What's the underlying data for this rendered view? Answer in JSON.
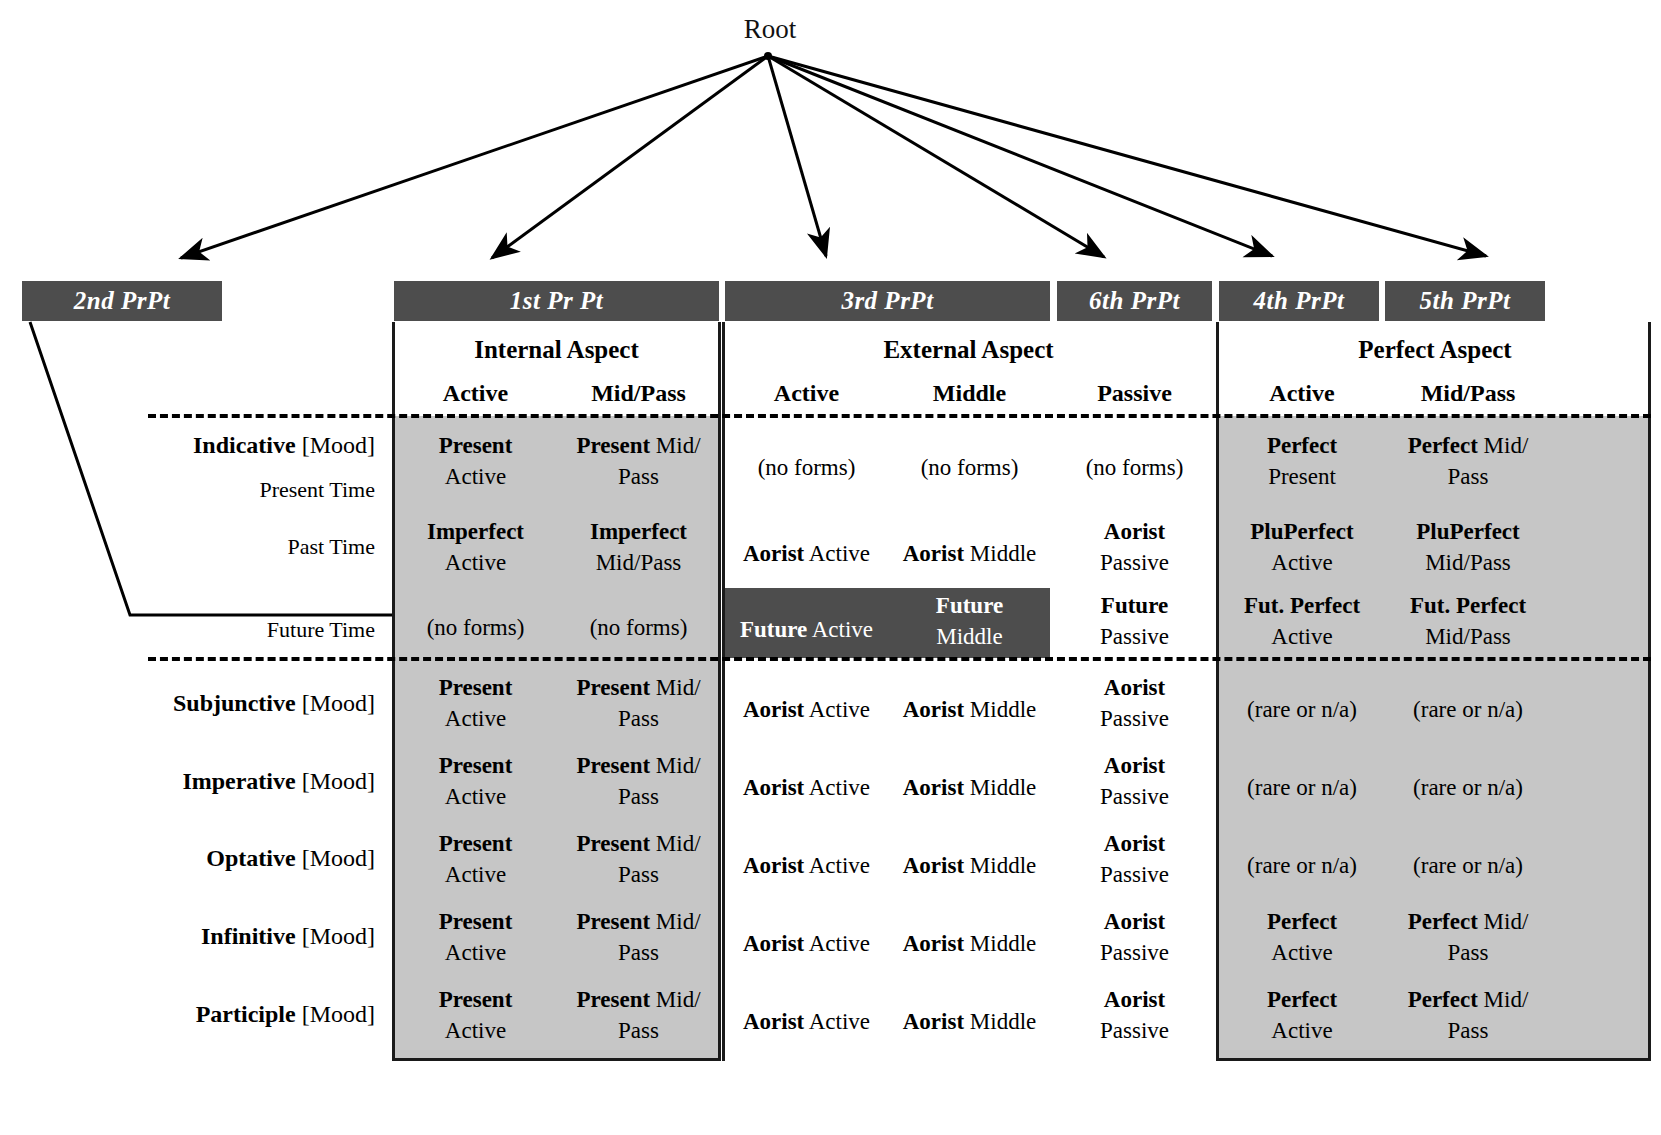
{
  "root": {
    "label": "Root"
  },
  "prpt_bars": [
    {
      "name": "2nd PrPt",
      "x": 22,
      "y": 281,
      "w": 200
    },
    {
      "name": "1st Pr Pt",
      "x": 394,
      "y": 281,
      "w": 325
    },
    {
      "name": "3rd PrPt",
      "x": 725,
      "y": 281,
      "w": 325
    },
    {
      "name": "6th PrPt",
      "x": 1057,
      "y": 281,
      "w": 155
    },
    {
      "name": "4th PrPt",
      "x": 1219,
      "y": 281,
      "w": 160
    },
    {
      "name": "5th PrPt",
      "x": 1385,
      "y": 281,
      "w": 160
    }
  ],
  "aspects": [
    {
      "label": "Internal Aspect",
      "x": 394,
      "w": 325
    },
    {
      "label": "External Aspect",
      "x": 725,
      "w": 487
    },
    {
      "label": "Perfect Aspect",
      "x": 1219,
      "w": 432
    }
  ],
  "voice_headers": [
    {
      "label": "Active",
      "x": 394,
      "w": 163
    },
    {
      "label": "Mid/Pass",
      "x": 557,
      "w": 163
    },
    {
      "label": "Active",
      "x": 725,
      "w": 163
    },
    {
      "label": "Middle",
      "x": 888,
      "w": 163
    },
    {
      "label": "Passive",
      "x": 1057,
      "w": 155
    },
    {
      "label": "Active",
      "x": 1219,
      "w": 166
    },
    {
      "label": "Mid/Pass",
      "x": 1385,
      "w": 166
    }
  ],
  "mood_rows": [
    {
      "mood": "Indicative",
      "suffix": " [Mood]",
      "time": ""
    },
    {
      "mood": "",
      "suffix": "",
      "time": "Present Time"
    },
    {
      "mood": "",
      "suffix": "",
      "time": "Past Time"
    },
    {
      "mood": "",
      "suffix": "",
      "time": "Future Time"
    },
    {
      "mood": "Subjunctive",
      "suffix": " [Mood]",
      "time": ""
    },
    {
      "mood": "Imperative",
      "suffix": " [Mood]",
      "time": ""
    },
    {
      "mood": "Optative",
      "suffix": " [Mood]",
      "time": ""
    },
    {
      "mood": "Infinitive",
      "suffix": " [Mood]",
      "time": ""
    },
    {
      "mood": "Participle",
      "suffix": " [Mood]",
      "time": ""
    }
  ],
  "table": {
    "present_indicative": {
      "internal_active": {
        "bold": "Present",
        "rest": "Active",
        "stacked": true
      },
      "internal_midpass": {
        "bold": "Present",
        "rest": "Mid/",
        "rest2": "Pass",
        "stacked": true
      },
      "external_active": {
        "bold": "",
        "rest": "(no forms)",
        "stacked": false
      },
      "external_middle": {
        "bold": "",
        "rest": "(no forms)",
        "stacked": false
      },
      "external_passive": {
        "bold": "",
        "rest": "(no forms)",
        "stacked": false
      },
      "perfect_active": {
        "bold": "Perfect",
        "rest": "Present",
        "stacked": true
      },
      "perfect_midpass": {
        "bold": "Perfect",
        "rest": "Mid/",
        "rest2": "Pass",
        "stacked": true
      }
    },
    "past_indicative": {
      "internal_active": {
        "bold": "Imperfect",
        "rest": "Active",
        "stacked": true
      },
      "internal_midpass": {
        "bold": "Imperfect",
        "rest": "Mid/Pass",
        "stacked": true
      },
      "external_active": {
        "bold": "Aorist",
        "rest": " Active",
        "stacked": false
      },
      "external_middle": {
        "bold": "Aorist",
        "rest": " Middle",
        "stacked": false
      },
      "external_passive": {
        "bold": "Aorist",
        "rest": "Passive",
        "stacked": true
      },
      "perfect_active": {
        "bold": "PluPerfect",
        "rest": "Active",
        "stacked": true
      },
      "perfect_midpass": {
        "bold": "PluPerfect",
        "rest": "Mid/Pass",
        "stacked": true
      }
    },
    "future_indicative": {
      "internal_active": {
        "bold": "",
        "rest": "(no forms)",
        "stacked": false
      },
      "internal_midpass": {
        "bold": "",
        "rest": "(no forms)",
        "stacked": false
      },
      "external_active": {
        "bold": "Future",
        "rest": " Active",
        "stacked": false
      },
      "external_middle": {
        "bold": "Future",
        "rest": "Middle",
        "stacked": true
      },
      "external_passive": {
        "bold": "Future",
        "rest": "Passive",
        "stacked": true
      },
      "perfect_active": {
        "bold": "Fut. Perfect",
        "rest": "Active",
        "stacked": true
      },
      "perfect_midpass": {
        "bold": "Fut. Perfect",
        "rest": "Mid/Pass",
        "stacked": true
      }
    },
    "subjunctive": {
      "internal_active": {
        "bold": "Present",
        "rest": "Active",
        "stacked": true
      },
      "internal_midpass": {
        "bold": "Present",
        "rest": "Mid/",
        "rest2": "Pass",
        "stacked": true
      },
      "external_active": {
        "bold": "Aorist",
        "rest": " Active",
        "stacked": false
      },
      "external_middle": {
        "bold": "Aorist",
        "rest": " Middle",
        "stacked": false
      },
      "external_passive": {
        "bold": "Aorist",
        "rest": "Passive",
        "stacked": true
      },
      "perfect_active": {
        "bold": "",
        "rest": "(rare or n/a)",
        "stacked": false
      },
      "perfect_midpass": {
        "bold": "",
        "rest": "(rare or n/a)",
        "stacked": false
      }
    },
    "imperative": {
      "internal_active": {
        "bold": "Present",
        "rest": "Active",
        "stacked": true
      },
      "internal_midpass": {
        "bold": "Present",
        "rest": "Mid/",
        "rest2": "Pass",
        "stacked": true
      },
      "external_active": {
        "bold": "Aorist",
        "rest": " Active",
        "stacked": false
      },
      "external_middle": {
        "bold": "Aorist",
        "rest": " Middle",
        "stacked": false
      },
      "external_passive": {
        "bold": "Aorist",
        "rest": "Passive",
        "stacked": true
      },
      "perfect_active": {
        "bold": "",
        "rest": "(rare or n/a)",
        "stacked": false
      },
      "perfect_midpass": {
        "bold": "",
        "rest": "(rare or n/a)",
        "stacked": false
      }
    },
    "optative": {
      "internal_active": {
        "bold": "Present",
        "rest": "Active",
        "stacked": true
      },
      "internal_midpass": {
        "bold": "Present",
        "rest": "Mid/",
        "rest2": "Pass",
        "stacked": true
      },
      "external_active": {
        "bold": "Aorist",
        "rest": " Active",
        "stacked": false
      },
      "external_middle": {
        "bold": "Aorist",
        "rest": " Middle",
        "stacked": false
      },
      "external_passive": {
        "bold": "Aorist",
        "rest": "Passive",
        "stacked": true
      },
      "perfect_active": {
        "bold": "",
        "rest": "(rare or n/a)",
        "stacked": false
      },
      "perfect_midpass": {
        "bold": "",
        "rest": "(rare or n/a)",
        "stacked": false
      }
    },
    "infinitive": {
      "internal_active": {
        "bold": "Present",
        "rest": "Active",
        "stacked": true
      },
      "internal_midpass": {
        "bold": "Present",
        "rest": "Mid/",
        "rest2": "Pass",
        "stacked": true
      },
      "external_active": {
        "bold": "Aorist",
        "rest": " Active",
        "stacked": false
      },
      "external_middle": {
        "bold": "Aorist",
        "rest": " Middle",
        "stacked": false
      },
      "external_passive": {
        "bold": "Aorist",
        "rest": "Passive",
        "stacked": true
      },
      "perfect_active": {
        "bold": "Perfect",
        "rest": "Active",
        "stacked": true
      },
      "perfect_midpass": {
        "bold": "Perfect",
        "rest": "Mid/",
        "rest2": "Pass",
        "stacked": true
      }
    },
    "participle": {
      "internal_active": {
        "bold": "Present",
        "rest": "Active",
        "stacked": true
      },
      "internal_midpass": {
        "bold": "Present",
        "rest": "Mid/",
        "rest2": "Pass",
        "stacked": true
      },
      "external_active": {
        "bold": "Aorist",
        "rest": " Active",
        "stacked": false
      },
      "external_middle": {
        "bold": "Aorist",
        "rest": " Middle",
        "stacked": false
      },
      "external_passive": {
        "bold": "Aorist",
        "rest": "Passive",
        "stacked": true
      },
      "perfect_active": {
        "bold": "Perfect",
        "rest": "Active",
        "stacked": true
      },
      "perfect_midpass": {
        "bold": "Perfect",
        "rest": "Mid/",
        "rest2": "Pass",
        "stacked": true
      }
    }
  },
  "colors": {
    "bar_fill": "#4d4d4d",
    "bar_text": "#ffffff",
    "panel_gray": "#c6c6c6",
    "highlight_dark": "#4d4d4d",
    "line": "#000000",
    "page_bg": "#ffffff"
  },
  "layout": {
    "row_y": [
      430,
      470,
      516,
      590,
      672,
      750,
      828,
      906,
      984
    ],
    "row_label_y": [
      432,
      475,
      533,
      616,
      690,
      768,
      845,
      923,
      1001
    ],
    "col_x": [
      394,
      557,
      725,
      888,
      1057,
      1219,
      1385
    ],
    "col_w": [
      163,
      163,
      163,
      163,
      155,
      166,
      166
    ]
  }
}
